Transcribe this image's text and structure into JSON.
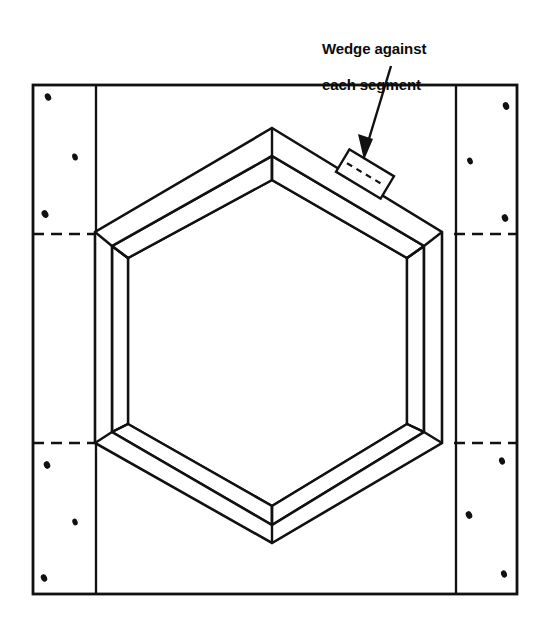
{
  "figure": {
    "background_color": "#ffffff",
    "ink_color": "#111111",
    "width": 550,
    "height": 618
  },
  "annotations": {
    "callout": {
      "line1": "Wedge against",
      "line2": "each segment",
      "full_text": "Wedge against each segment",
      "leader_start": [
        389,
        68
      ],
      "leader_end": [
        364,
        156
      ],
      "arrow_head": "down-left"
    }
  },
  "outer_panel": {
    "name": "outer rectangular form frame",
    "left": 33,
    "top": 85,
    "right": 517,
    "bottom": 594,
    "stroke_width": 2.6
  },
  "side_bands": {
    "left_band_inner_edge_x": 96,
    "right_band_inner_edge_x": 456,
    "stroke_width": 2.2
  },
  "dashed_lines": [
    {
      "name": "upper-dash-left",
      "x1": 33,
      "x2": 96,
      "y": 234
    },
    {
      "name": "upper-dash-right",
      "x1": 456,
      "x2": 517,
      "y": 234
    },
    {
      "name": "lower-dash-left",
      "x1": 33,
      "x2": 96,
      "y": 443
    },
    {
      "name": "lower-dash-right",
      "x1": 456,
      "x2": 517,
      "y": 443
    }
  ],
  "fasteners": [
    {
      "name": "nail-left-upper-1",
      "cx": 48,
      "cy": 97,
      "rx": 3.0,
      "ry": 3.8,
      "rot": -25
    },
    {
      "name": "nail-left-upper-2",
      "cx": 75,
      "cy": 157,
      "rx": 2.8,
      "ry": 3.6,
      "rot": -20
    },
    {
      "name": "nail-left-upper-3",
      "cx": 45,
      "cy": 214,
      "rx": 3.2,
      "ry": 3.9,
      "rot": -30
    },
    {
      "name": "nail-left-lower-1",
      "cx": 47,
      "cy": 465,
      "rx": 3.1,
      "ry": 3.8,
      "rot": -22
    },
    {
      "name": "nail-left-lower-2",
      "cx": 75,
      "cy": 522,
      "rx": 2.7,
      "ry": 3.5,
      "rot": -18
    },
    {
      "name": "nail-left-lower-3",
      "cx": 44,
      "cy": 578,
      "rx": 3.0,
      "ry": 3.7,
      "rot": -26
    },
    {
      "name": "nail-right-upper-1",
      "cx": 506,
      "cy": 106,
      "rx": 3.1,
      "ry": 3.8,
      "rot": -20
    },
    {
      "name": "nail-right-upper-2",
      "cx": 470,
      "cy": 161,
      "rx": 2.8,
      "ry": 3.5,
      "rot": -24
    },
    {
      "name": "nail-right-upper-3",
      "cx": 505,
      "cy": 218,
      "rx": 3.1,
      "ry": 3.8,
      "rot": -22
    },
    {
      "name": "nail-right-lower-1",
      "cx": 502,
      "cy": 461,
      "rx": 2.9,
      "ry": 3.6,
      "rot": -20
    },
    {
      "name": "nail-right-lower-2",
      "cx": 469,
      "cy": 515,
      "rx": 3.1,
      "ry": 3.8,
      "rot": -25
    },
    {
      "name": "nail-right-lower-3",
      "cx": 504,
      "cy": 574,
      "rx": 2.9,
      "ry": 3.6,
      "rot": -21
    }
  ],
  "hexagon_form": {
    "name": "hexagonal segmented form (6 segments)",
    "outer_top_face": [
      [
        272,
        128
      ],
      [
        442,
        232
      ],
      [
        442,
        443
      ],
      [
        272,
        543
      ],
      [
        95,
        443
      ],
      [
        95,
        232
      ]
    ],
    "inner_top_face": [
      [
        272,
        156
      ],
      [
        424,
        246
      ],
      [
        424,
        432
      ],
      [
        272,
        525
      ],
      [
        112,
        432
      ],
      [
        112,
        246
      ]
    ],
    "inner_bottom_face": [
      [
        272,
        180
      ],
      [
        407,
        258
      ],
      [
        407,
        424
      ],
      [
        272,
        506
      ],
      [
        128,
        424
      ],
      [
        128,
        258
      ]
    ],
    "vertical_edges": [
      {
        "from": [
          272,
          156
        ],
        "to": [
          272,
          180
        ]
      },
      {
        "from": [
          424,
          246
        ],
        "to": [
          424,
          272
        ]
      },
      {
        "from": [
          112,
          246
        ],
        "to": [
          112,
          272
        ]
      },
      {
        "from": [
          128,
          424
        ],
        "to": [
          128,
          448
        ]
      },
      {
        "from": [
          407,
          424
        ],
        "to": [
          407,
          448
        ]
      }
    ],
    "stroke_width": 2.4
  },
  "wedge": {
    "name": "wedge block against top-right segment",
    "center": [
      365,
      174
    ],
    "width": 52,
    "height": 26,
    "rotation_deg": 31,
    "dashed_centerline": true,
    "stroke_width": 2.2
  }
}
